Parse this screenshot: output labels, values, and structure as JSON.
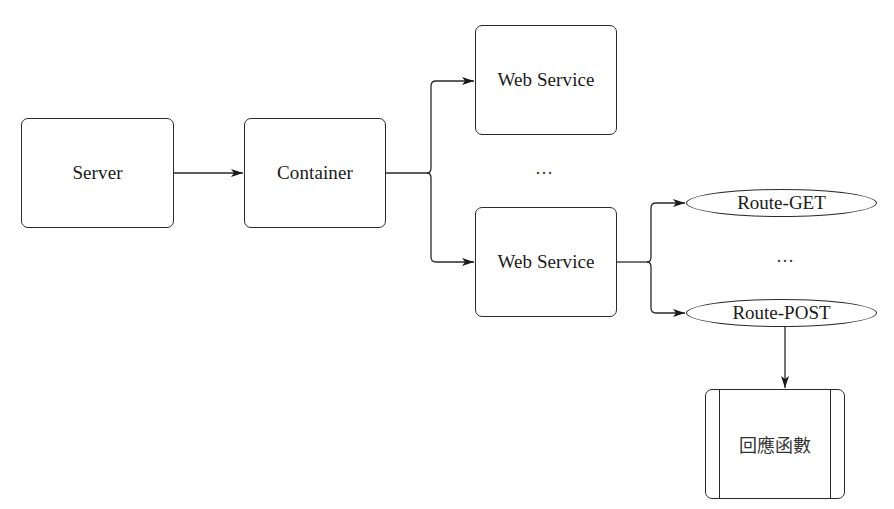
{
  "diagram": {
    "type": "flowchart",
    "nodes": {
      "server": {
        "label": "Server",
        "shape": "rounded-rect"
      },
      "container": {
        "label": "Container",
        "shape": "rounded-rect"
      },
      "web_service_1": {
        "label": "Web Service",
        "shape": "rounded-rect"
      },
      "web_service_2": {
        "label": "Web Service",
        "shape": "rounded-rect"
      },
      "route_get": {
        "label": "Route-GET",
        "shape": "ellipse"
      },
      "route_post": {
        "label": "Route-POST",
        "shape": "ellipse"
      },
      "callback": {
        "label": "回應函數",
        "shape": "predefined-process"
      }
    },
    "ellipses": {
      "web_services": "…",
      "routes": "…"
    },
    "edges": [
      {
        "from": "server",
        "to": "container"
      },
      {
        "from": "container",
        "to": "web_service_1"
      },
      {
        "from": "container",
        "to": "web_service_2"
      },
      {
        "from": "web_service_2",
        "to": "route_get"
      },
      {
        "from": "web_service_2",
        "to": "route_post"
      },
      {
        "from": "route_post",
        "to": "callback"
      }
    ],
    "colors": {
      "stroke": "#2a2a2a",
      "background": "#ffffff",
      "text": "#1a1a1a"
    }
  }
}
